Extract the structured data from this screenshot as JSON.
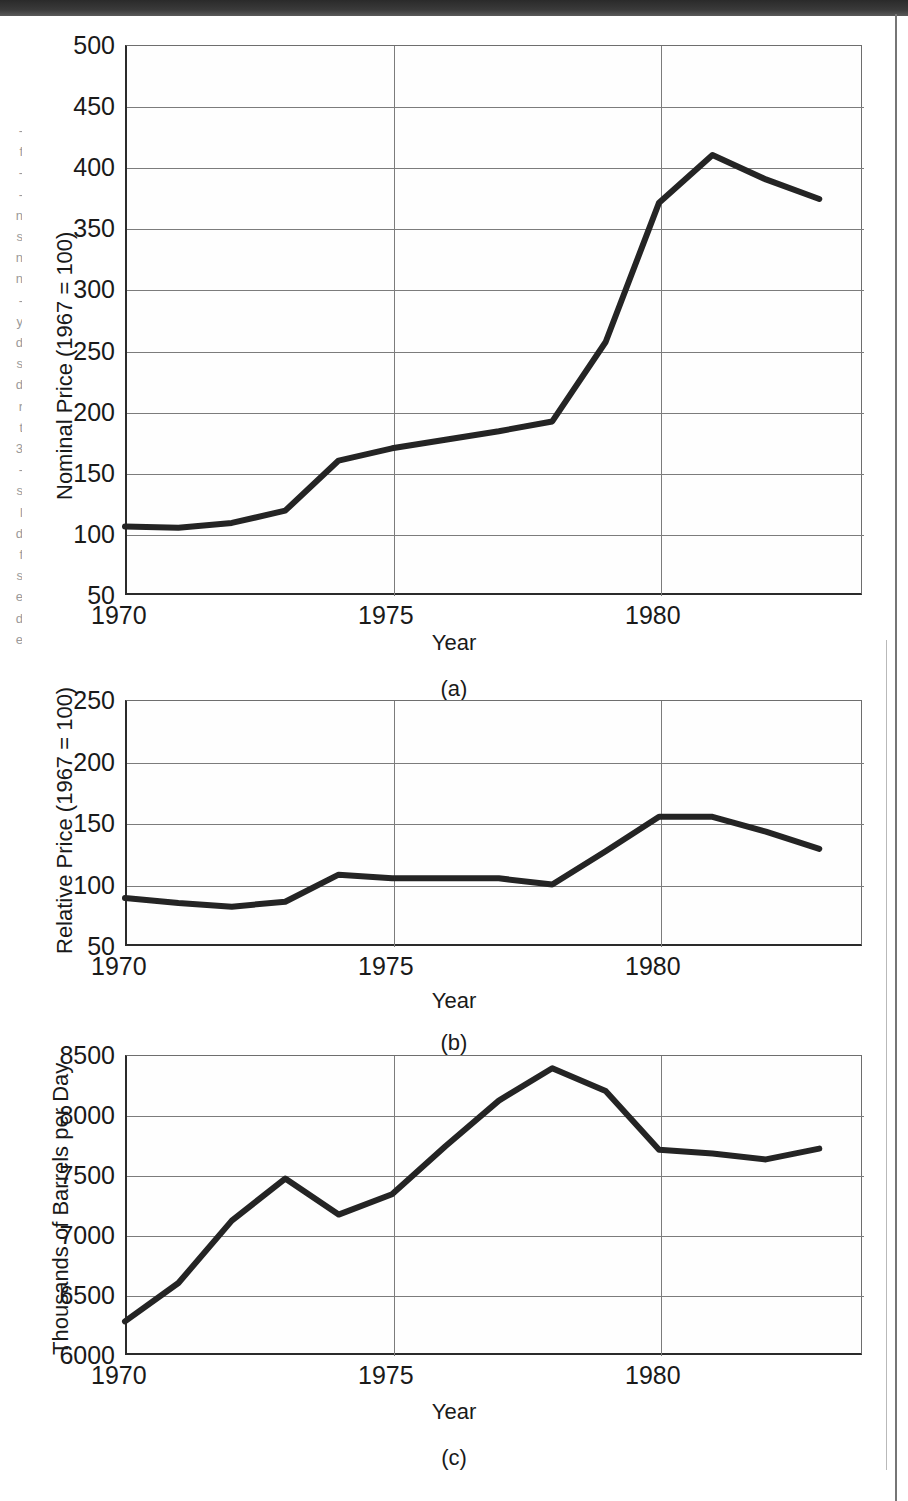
{
  "figure": {
    "xlabel": "Year",
    "panel_labels": [
      "(a)",
      "(b)",
      "(c)"
    ],
    "margin_bleed_fragments": "-\nf\n-\n-\nn\ns\nn\nn\n-\ny\nd\ns\nd\nr\nt\n3\n-\ns\nl\nd\nf\ns\ne\nd\ne"
  },
  "chart_data": [
    {
      "id": "panel-a",
      "type": "line",
      "title": "",
      "panel": "(a)",
      "xlabel": "Year",
      "ylabel": "Nominal Price (1967 = 100)",
      "xlim": [
        1970,
        1983.8
      ],
      "ylim": [
        50,
        500
      ],
      "yticks": [
        50,
        100,
        150,
        200,
        250,
        300,
        350,
        400,
        450,
        500
      ],
      "xticks": [
        1970,
        1975,
        1980
      ],
      "grid": true,
      "legend": "none",
      "x": [
        1970,
        1971,
        1972,
        1973,
        1974,
        1975,
        1976,
        1977,
        1978,
        1979,
        1980,
        1981,
        1982,
        1983
      ],
      "values": [
        106,
        105,
        109,
        119,
        160,
        170,
        177,
        184,
        192,
        257,
        371,
        410,
        390,
        374
      ]
    },
    {
      "id": "panel-b",
      "type": "line",
      "title": "",
      "panel": "(b)",
      "xlabel": "Year",
      "ylabel": "Relative Price (1967 = 100)",
      "xlim": [
        1970,
        1983.8
      ],
      "ylim": [
        50,
        250
      ],
      "yticks": [
        50,
        100,
        150,
        200,
        250
      ],
      "xticks": [
        1970,
        1975,
        1980
      ],
      "grid": true,
      "legend": "none",
      "x": [
        1970,
        1971,
        1972,
        1973,
        1974,
        1975,
        1976,
        1977,
        1978,
        1979,
        1980,
        1981,
        1982,
        1983
      ],
      "values": [
        89,
        85,
        82,
        86,
        108,
        105,
        105,
        105,
        100,
        127,
        155,
        155,
        143,
        129
      ]
    },
    {
      "id": "panel-c",
      "type": "line",
      "title": "",
      "panel": "(c)",
      "xlabel": "Year",
      "ylabel": "Thousands of Barrels per Day",
      "xlim": [
        1970,
        1983.8
      ],
      "ylim": [
        6000,
        8500
      ],
      "yticks": [
        6000,
        6500,
        7000,
        7500,
        8000,
        8500
      ],
      "xticks": [
        1970,
        1975,
        1980
      ],
      "grid": true,
      "legend": "none",
      "x": [
        1970,
        1971,
        1972,
        1973,
        1974,
        1975,
        1976,
        1977,
        1978,
        1979,
        1980,
        1981,
        1982,
        1983
      ],
      "values": [
        6280,
        6600,
        7120,
        7470,
        7170,
        7340,
        7740,
        8120,
        8390,
        8200,
        7710,
        7680,
        7630,
        7720
      ]
    }
  ]
}
